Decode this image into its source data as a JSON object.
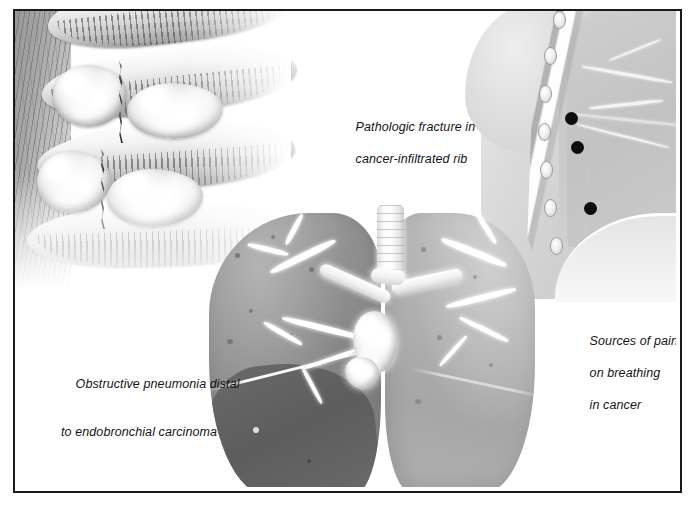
{
  "figure": {
    "kind": "medical-illustration",
    "border_color": "#1a1a1a",
    "background": "#ffffff"
  },
  "captions": {
    "pathologic_fracture": {
      "line1": "Pathologic fracture in",
      "line2": "cancer-infiltrated rib"
    },
    "obstructive_pneumonia": {
      "line1": "Obstructive pneumonia distal",
      "line2": "to endobronchial carcinoma"
    },
    "sources_of_pain": {
      "line1": "Sources of pain",
      "line2": "on breathing",
      "line3": "in cancer"
    }
  },
  "panels": {
    "rib_panel": {
      "name": "cancer-infiltrated ribs with pathologic fractures",
      "ribs": 4,
      "fractures": 2,
      "tumor_masses": 4,
      "muscle_color": "#9a9a9a",
      "bone_color": "#eeeeee"
    },
    "chest_inset": {
      "name": "sagittal chest wall section showing sources of pain on breathing",
      "pain_dot_count": 3,
      "pain_dot_color": "#0d0d0d",
      "structures": [
        "chest wall",
        "ribs",
        "parietal pleura",
        "lung",
        "diaphragm"
      ]
    },
    "lungs": {
      "name": "bilateral lungs with endobronchial carcinoma and obstructive pneumonia",
      "right_lung_color": "#8a8a8a",
      "left_lung_color": "#b0b0b0",
      "consolidation_color": "#606060",
      "trachea_label": "trachea",
      "arrow_color": "#000000",
      "arrow_direction": "left",
      "arrow_points_to": "endobronchial carcinoma mass"
    }
  }
}
